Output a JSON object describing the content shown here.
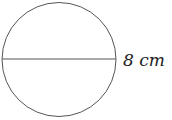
{
  "diagram": {
    "shape": "circle",
    "diameter_label": "8 cm",
    "stroke_color": "#555555"
  }
}
